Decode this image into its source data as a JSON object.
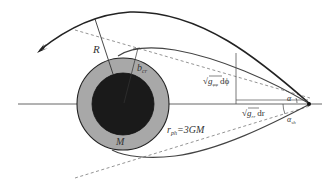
{
  "diagram": {
    "colors": {
      "background": "#ffffff",
      "outer_ring": "#a8a8a8",
      "inner_core": "#1a1a1a",
      "line": "#333333",
      "thin_line": "#555555",
      "dashed": "#888888"
    },
    "labels": {
      "R": "R",
      "b_cr_main": "b",
      "b_cr_sub": "cr",
      "sqrt_gpp_dphi_prefix": "√",
      "gpp_main": "g",
      "gpp_sub": "φφ",
      "dphi": "dϕ",
      "alpha": "α",
      "sqrt_grr_dr_prefix": "√",
      "grr_main": "g",
      "grr_sub": "rr",
      "dr": "dr",
      "alpha_sh_main": "α",
      "alpha_sh_sub": "sh",
      "r_ph_main": "r",
      "r_ph_sub": "ph",
      "r_ph_value": "=3GM",
      "M": "M"
    }
  }
}
